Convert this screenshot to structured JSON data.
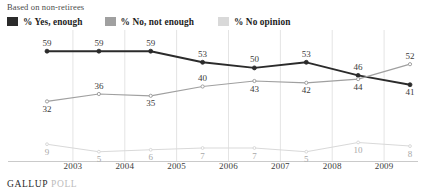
{
  "subtitle": "Based on non-retirees",
  "footer": {
    "brand": "GALLUP",
    "poll": "POLL"
  },
  "legend": {
    "items": [
      {
        "label": "% Yes, enough",
        "color": "#2b2b2b"
      },
      {
        "label": "% No, not enough",
        "color": "#a0a0a0"
      },
      {
        "label": "% No opinion",
        "color": "#d9d9d9"
      }
    ]
  },
  "chart_data": {
    "type": "line",
    "title": "",
    "subtitle": "Based on non-retirees",
    "xlabel": "",
    "ylabel": "",
    "ylim": [
      0,
      65
    ],
    "grid": "vertical",
    "legend_position": "top-left",
    "categories": [
      "",
      "2003",
      "2004",
      "2005",
      "2006",
      "2007",
      "2008",
      "2009"
    ],
    "x_tick_labels": [
      "2003",
      "2004",
      "2005",
      "2006",
      "2007",
      "2008",
      "2009"
    ],
    "series": [
      {
        "name": "% Yes, enough",
        "color": "#2b2b2b",
        "values": [
          59,
          59,
          59,
          53,
          50,
          53,
          46,
          41
        ]
      },
      {
        "name": "% No, not enough",
        "color": "#a0a0a0",
        "values": [
          32,
          36,
          35,
          40,
          43,
          42,
          44,
          52
        ]
      },
      {
        "name": "% No opinion",
        "color": "#d9d9d9",
        "values": [
          9,
          5,
          6,
          7,
          7,
          5,
          10,
          8
        ]
      }
    ]
  }
}
